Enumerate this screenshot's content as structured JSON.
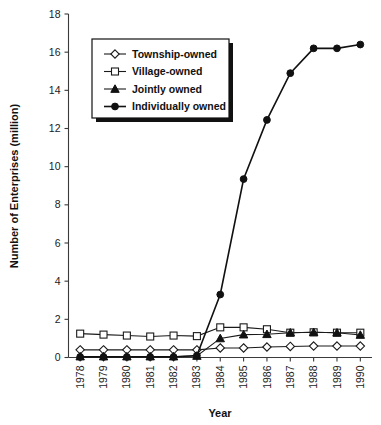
{
  "chart_data": {
    "type": "line",
    "title": "",
    "xlabel": "Year",
    "ylabel": "Number of Enterprises (million)",
    "categories": [
      "1978",
      "1979",
      "1980",
      "1981",
      "1982",
      "1983",
      "1984",
      "1985",
      "1986",
      "1987",
      "1988",
      "1989",
      "1990"
    ],
    "x": [
      1978,
      1979,
      1980,
      1981,
      1982,
      1983,
      1984,
      1985,
      1986,
      1987,
      1988,
      1989,
      1990
    ],
    "ylim": [
      0,
      18
    ],
    "yticks": [
      0,
      2,
      4,
      6,
      8,
      10,
      12,
      14,
      16,
      18
    ],
    "ytick_labels": [
      "0",
      "2",
      "4",
      "6",
      "8",
      "10",
      "12",
      "14",
      "16",
      "18"
    ],
    "grid": false,
    "legend_position": "upper-left",
    "series": [
      {
        "name": "Township-owned",
        "marker": "open-diamond",
        "values": [
          0.4,
          0.4,
          0.4,
          0.4,
          0.4,
          0.4,
          0.5,
          0.5,
          0.55,
          0.58,
          0.6,
          0.6,
          0.6
        ]
      },
      {
        "name": "Village-owned",
        "marker": "open-square",
        "values": [
          1.25,
          1.2,
          1.15,
          1.1,
          1.15,
          1.12,
          1.58,
          1.58,
          1.48,
          1.3,
          1.32,
          1.3,
          1.3
        ]
      },
      {
        "name": "Jointly owned",
        "marker": "filled-triangle",
        "values": [
          0.05,
          0.05,
          0.05,
          0.05,
          0.05,
          0.08,
          1.0,
          1.2,
          1.22,
          1.3,
          1.32,
          1.3,
          1.18
        ]
      },
      {
        "name": "Individually owned",
        "marker": "filled-circle",
        "values": [
          0.03,
          0.03,
          0.03,
          0.03,
          0.03,
          0.1,
          3.3,
          9.35,
          12.45,
          14.9,
          16.2,
          16.2,
          16.4
        ]
      }
    ]
  },
  "legend": {
    "entries": [
      {
        "label": "Township-owned",
        "marker": "open-diamond"
      },
      {
        "label": "Village-owned",
        "marker": "open-square"
      },
      {
        "label": "Jointly owned",
        "marker": "filled-triangle"
      },
      {
        "label": "Individually owned",
        "marker": "filled-circle"
      }
    ]
  },
  "colors": {
    "line": "#1a1a1a",
    "axis": "#3a3a3a",
    "background": "#ffffff",
    "text": "#111111"
  }
}
